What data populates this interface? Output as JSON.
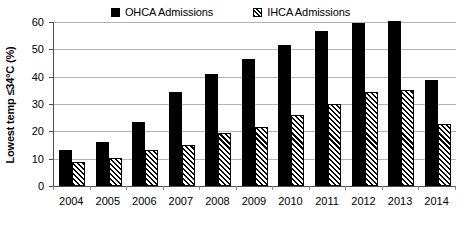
{
  "chart_data": {
    "type": "bar",
    "title": "",
    "xlabel": "",
    "ylabel": "Lowest temp ≤34°C (%)",
    "ylim": [
      0,
      60
    ],
    "ytick_step": 10,
    "yticks": [
      "60",
      "50",
      "40",
      "30",
      "20",
      "10",
      "0"
    ],
    "grid": true,
    "legend_position": "top-center",
    "categories": [
      "2004",
      "2005",
      "2006",
      "2007",
      "2008",
      "2009",
      "2010",
      "2011",
      "2012",
      "2013",
      "2014"
    ],
    "series": [
      {
        "name": "OHCA Admissions",
        "pattern": "solid",
        "color": "#000000",
        "values": [
          13.0,
          16.2,
          23.5,
          34.4,
          41.0,
          46.5,
          51.5,
          56.7,
          59.5,
          60.2,
          38.9
        ]
      },
      {
        "name": "IHCA Admissions",
        "pattern": "diagonal-hatch",
        "color": "#000000",
        "values": [
          8.7,
          10.2,
          13.0,
          15.0,
          19.4,
          21.5,
          26.1,
          29.9,
          34.3,
          35.2,
          22.8
        ]
      }
    ]
  },
  "legend": {
    "entries": [
      {
        "label": "OHCA Admissions",
        "swatch": "solid-square-icon"
      },
      {
        "label": "IHCA Admissions",
        "swatch": "hatched-square-icon"
      }
    ]
  },
  "axis": {
    "y_title": "Lowest temp ≤34°C (%)"
  }
}
